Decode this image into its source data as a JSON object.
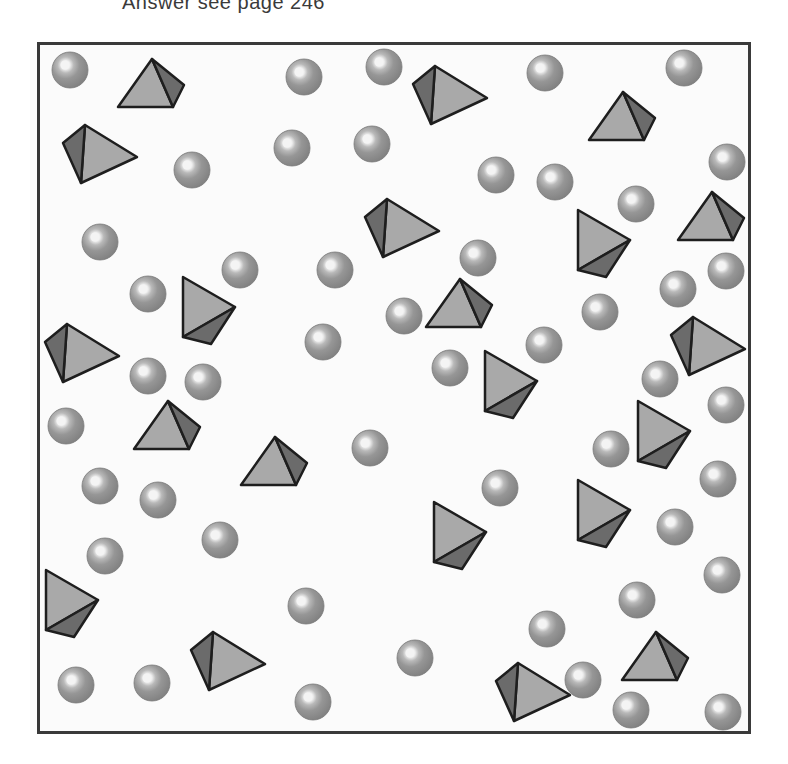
{
  "caption": "Answer see page 246",
  "colors": {
    "frame_border": "#3a3a3a",
    "background": "#fbfbfb",
    "sphere_base": "#8f8f8f",
    "sphere_edge": "#7a7a7a",
    "sphere_highlight": "#f4f4f4",
    "pyramid_light_face": "#a9a9a9",
    "pyramid_dark_face": "#6b6b6b",
    "pyramid_outline": "#1e1e1e"
  },
  "spheres": [
    {
      "x": 70,
      "y": 70
    },
    {
      "x": 192,
      "y": 170
    },
    {
      "x": 304,
      "y": 77
    },
    {
      "x": 384,
      "y": 67
    },
    {
      "x": 292,
      "y": 148
    },
    {
      "x": 372,
      "y": 144
    },
    {
      "x": 545,
      "y": 73
    },
    {
      "x": 684,
      "y": 68
    },
    {
      "x": 727,
      "y": 162
    },
    {
      "x": 496,
      "y": 175
    },
    {
      "x": 555,
      "y": 182
    },
    {
      "x": 636,
      "y": 204
    },
    {
      "x": 100,
      "y": 242
    },
    {
      "x": 148,
      "y": 294
    },
    {
      "x": 240,
      "y": 270
    },
    {
      "x": 335,
      "y": 270
    },
    {
      "x": 478,
      "y": 258
    },
    {
      "x": 404,
      "y": 316
    },
    {
      "x": 323,
      "y": 342
    },
    {
      "x": 600,
      "y": 312
    },
    {
      "x": 678,
      "y": 289
    },
    {
      "x": 726,
      "y": 271
    },
    {
      "x": 544,
      "y": 345
    },
    {
      "x": 450,
      "y": 368
    },
    {
      "x": 148,
      "y": 376
    },
    {
      "x": 203,
      "y": 382
    },
    {
      "x": 660,
      "y": 379
    },
    {
      "x": 726,
      "y": 405
    },
    {
      "x": 66,
      "y": 426
    },
    {
      "x": 370,
      "y": 448
    },
    {
      "x": 611,
      "y": 449
    },
    {
      "x": 100,
      "y": 486
    },
    {
      "x": 158,
      "y": 500
    },
    {
      "x": 500,
      "y": 488
    },
    {
      "x": 718,
      "y": 479
    },
    {
      "x": 675,
      "y": 527
    },
    {
      "x": 220,
      "y": 540
    },
    {
      "x": 105,
      "y": 556
    },
    {
      "x": 637,
      "y": 600
    },
    {
      "x": 722,
      "y": 575
    },
    {
      "x": 306,
      "y": 606
    },
    {
      "x": 547,
      "y": 629
    },
    {
      "x": 415,
      "y": 658
    },
    {
      "x": 583,
      "y": 680
    },
    {
      "x": 76,
      "y": 685
    },
    {
      "x": 152,
      "y": 683
    },
    {
      "x": 313,
      "y": 702
    },
    {
      "x": 631,
      "y": 710
    },
    {
      "x": 723,
      "y": 712
    }
  ],
  "pyramids": [
    {
      "type": "up",
      "x": 152,
      "y": 84
    },
    {
      "type": "left",
      "x": 97,
      "y": 153
    },
    {
      "type": "left",
      "x": 447,
      "y": 94
    },
    {
      "type": "up",
      "x": 623,
      "y": 117
    },
    {
      "type": "left",
      "x": 399,
      "y": 227
    },
    {
      "type": "down",
      "x": 601,
      "y": 243
    },
    {
      "type": "up",
      "x": 712,
      "y": 217
    },
    {
      "type": "down",
      "x": 206,
      "y": 310
    },
    {
      "type": "up",
      "x": 460,
      "y": 304
    },
    {
      "type": "left",
      "x": 79,
      "y": 352
    },
    {
      "type": "left",
      "x": 705,
      "y": 345
    },
    {
      "type": "down",
      "x": 508,
      "y": 384
    },
    {
      "type": "up",
      "x": 168,
      "y": 426
    },
    {
      "type": "down",
      "x": 661,
      "y": 434
    },
    {
      "type": "up",
      "x": 275,
      "y": 462
    },
    {
      "type": "down",
      "x": 457,
      "y": 535
    },
    {
      "type": "down",
      "x": 601,
      "y": 513
    },
    {
      "type": "down",
      "x": 69,
      "y": 603
    },
    {
      "type": "left",
      "x": 225,
      "y": 660
    },
    {
      "type": "up",
      "x": 656,
      "y": 657
    },
    {
      "type": "left",
      "x": 530,
      "y": 691
    }
  ]
}
